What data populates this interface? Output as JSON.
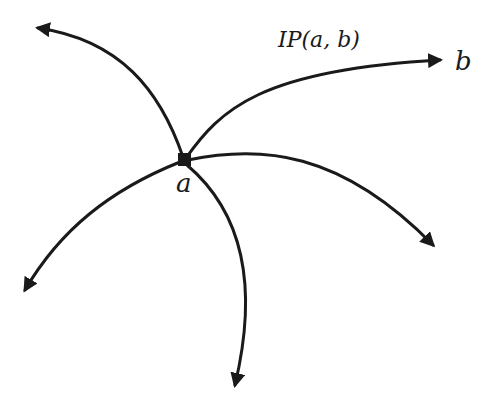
{
  "diagram": {
    "node": {
      "label": "a",
      "shape": "square",
      "color": "#1a1a1a"
    },
    "target": {
      "label": "b"
    },
    "edge_label": "IP(a, b)",
    "paths": [
      {
        "name": "path-to-b",
        "direction": "upper-right",
        "labeled": true
      },
      {
        "name": "path-upper-left",
        "direction": "upper-left"
      },
      {
        "name": "path-right",
        "direction": "right-down"
      },
      {
        "name": "path-lower-left",
        "direction": "lower-left"
      },
      {
        "name": "path-down",
        "direction": "down"
      }
    ],
    "stroke_color": "#1a1a1a",
    "background": "#ffffff"
  }
}
